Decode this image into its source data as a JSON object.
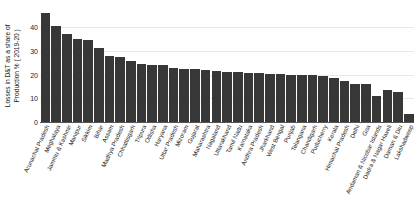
{
  "chart_data": {
    "type": "bar",
    "title": "",
    "xlabel": "",
    "ylabel": "Losses in D&T as a share of Production % ( 2019-20 )",
    "ylabel_line1": "Losses in D&T as a share of",
    "ylabel_line2": "Production % ( 2019-20 )",
    "ylim": [
      0,
      48
    ],
    "yticks": [
      0,
      10,
      20,
      30,
      40
    ],
    "ytick_labels": [
      "0",
      "10",
      "20",
      "30",
      "40"
    ],
    "grid": true,
    "grid_axis": "y",
    "legend": false,
    "bar_color": "#373737",
    "categories": [
      "Arunachal Pradesh",
      "Meghalaya",
      "Jammu & Kashmir",
      "Manipur",
      "Sikkim",
      "Bihar",
      "Assam",
      "Madhya Pradesh",
      "Chhattisgarh",
      "Tripura",
      "Odisha",
      "Haryana",
      "Uttar Pradesh",
      "Mizoram",
      "Gujarat",
      "Maharashtra",
      "Nagaland",
      "Uttarakhand",
      "Tamil Nadu",
      "Karnataka",
      "Andhra Pradesh",
      "Jharkhand",
      "West Bengal",
      "Punjab",
      "Telangana",
      "Chandigarh",
      "Puducherry",
      "Kerala",
      "Himachal Pradesh",
      "Delhi",
      "Goa",
      "Andaman & Nicobar Islands",
      "Dadra & Nagar Haveli",
      "Daman & Diu",
      "Lakshadweep"
    ],
    "values": [
      46.0,
      40.5,
      37.2,
      34.8,
      34.5,
      31.3,
      27.8,
      27.2,
      25.7,
      24.3,
      24.2,
      24.2,
      22.6,
      22.5,
      22.3,
      22.0,
      21.5,
      21.2,
      21.0,
      20.8,
      20.6,
      20.4,
      20.2,
      20.0,
      19.8,
      19.6,
      19.3,
      18.6,
      17.4,
      16.0,
      15.8,
      11.0,
      13.5,
      12.6,
      3.2
    ]
  }
}
